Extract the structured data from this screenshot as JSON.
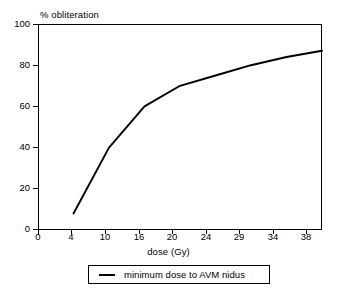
{
  "chart_data": {
    "type": "line",
    "title": "",
    "xlabel": "dose (Gy)",
    "ylabel": "% obliteration",
    "categories": [
      "0",
      "4",
      "10",
      "16",
      "20",
      "24",
      "29",
      "34",
      "38"
    ],
    "x_tick_labels": [
      "0",
      "4",
      "10",
      "16",
      "20",
      "24",
      "29",
      "34",
      "38"
    ],
    "y_tick_labels": [
      "0",
      "20",
      "40",
      "60",
      "80",
      "100"
    ],
    "ylim": [
      0,
      100
    ],
    "grid": false,
    "legend_position": "bottom",
    "series": [
      {
        "name": "minimum dose to AVM nidus",
        "color": "#000000",
        "x": [
          4,
          10,
          16,
          20,
          24,
          29,
          34,
          38
        ],
        "values": [
          8,
          40,
          60,
          70,
          75,
          80,
          84,
          87
        ]
      }
    ],
    "annotations": []
  },
  "axes": {
    "y_title": "% obliteration",
    "x_title": "dose (Gy)",
    "y_ticks": [
      {
        "label": "0",
        "value": 0
      },
      {
        "label": "20",
        "value": 20
      },
      {
        "label": "40",
        "value": 40
      },
      {
        "label": "60",
        "value": 60
      },
      {
        "label": "80",
        "value": 80
      },
      {
        "label": "100",
        "value": 100
      }
    ],
    "x_ticks": [
      {
        "label": "0",
        "value": 0
      },
      {
        "label": "4",
        "value": 4
      },
      {
        "label": "10",
        "value": 10
      },
      {
        "label": "16",
        "value": 16
      },
      {
        "label": "20",
        "value": 20
      },
      {
        "label": "24",
        "value": 24
      },
      {
        "label": "29",
        "value": 29
      },
      {
        "label": "34",
        "value": 34
      },
      {
        "label": "38",
        "value": 38
      }
    ]
  },
  "legend": {
    "entries": [
      {
        "label": "minimum dose to AVM nidus",
        "color": "#000000"
      }
    ]
  },
  "colors": {
    "line": "#000000",
    "frame": "#000000",
    "background": "#ffffff",
    "text": "#000000"
  }
}
